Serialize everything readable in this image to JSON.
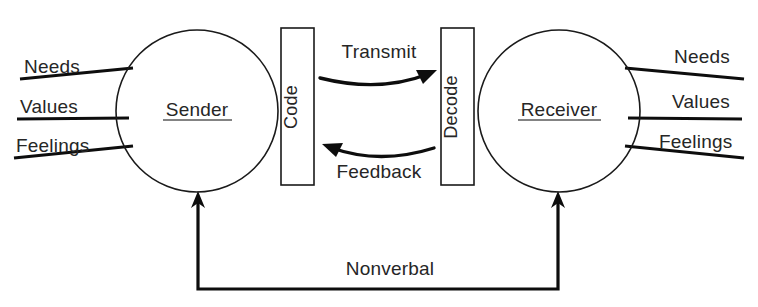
{
  "diagram": {
    "background_color": "#ffffff",
    "line_color": "#0d0d0d",
    "text_color": "#262626",
    "nodes": {
      "sender": {
        "label": "Sender",
        "shape": "circle",
        "cx": 197,
        "cy": 111,
        "r": 81
      },
      "receiver": {
        "label": "Receiver",
        "shape": "circle",
        "cx": 559,
        "cy": 111,
        "r": 81
      },
      "code": {
        "label": "Code",
        "shape": "rectangle",
        "x": 281,
        "y": 28,
        "w": 33,
        "h": 157,
        "orientation": "vertical"
      },
      "decode": {
        "label": "Decode",
        "shape": "rectangle",
        "x": 441,
        "y": 28,
        "w": 33,
        "h": 157,
        "orientation": "vertical"
      }
    },
    "flows": {
      "transmit": {
        "label": "Transmit",
        "direction": "sender-to-receiver",
        "label_x": 379,
        "label_y": 58
      },
      "feedback": {
        "label": "Feedback",
        "direction": "receiver-to-sender",
        "label_x": 379,
        "label_y": 173
      },
      "nonverbal": {
        "label": "Nonverbal",
        "direction": "bidirectional-bottom",
        "label_x": 390,
        "label_y": 272
      }
    },
    "sender_inputs": {
      "title": "Sender attributes",
      "items": [
        {
          "label": "Needs",
          "x": 24,
          "y": 66
        },
        {
          "label": "Values",
          "x": 20,
          "y": 106
        },
        {
          "label": "Feelings",
          "x": 16,
          "y": 145
        }
      ]
    },
    "receiver_inputs": {
      "title": "Receiver attributes",
      "items": [
        {
          "label": "Needs",
          "x": 674,
          "y": 66
        },
        {
          "label": "Values",
          "x": 672,
          "y": 106
        },
        {
          "label": "Feelings",
          "x": 659,
          "y": 145
        }
      ]
    }
  }
}
